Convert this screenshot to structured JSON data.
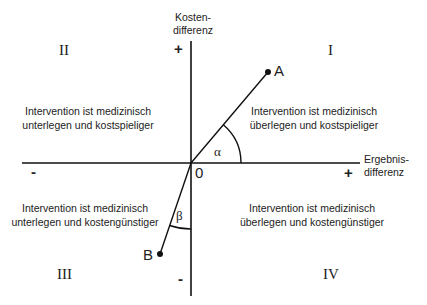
{
  "diagram": {
    "y_axis": {
      "label_line1": "Kosten-",
      "label_line2": "differenz",
      "plus": "+",
      "minus": "-"
    },
    "x_axis": {
      "label_line1": "Ergebnis-",
      "label_line2": "differenz",
      "plus": "+",
      "minus": "-"
    },
    "origin": "0",
    "quadrants": [
      {
        "numeral": "I",
        "line1": "Intervention ist medizinisch",
        "line2": "überlegen und kostspieliger"
      },
      {
        "numeral": "II",
        "line1": "Intervention ist medizinisch",
        "line2": "unterlegen und kostspieliger"
      },
      {
        "numeral": "III",
        "line1": "Intervention ist medizinisch",
        "line2": "unterlegen und kostengünstiger"
      },
      {
        "numeral": "IV",
        "line1": "Intervention ist medizinisch",
        "line2": "überlegen und kostengünstiger"
      }
    ],
    "points": [
      {
        "label": "A",
        "angle_label": "α"
      },
      {
        "label": "B",
        "angle_label": "β"
      }
    ],
    "colors": {
      "line": "#111111",
      "text": "#222222",
      "background": "#ffffff"
    }
  }
}
